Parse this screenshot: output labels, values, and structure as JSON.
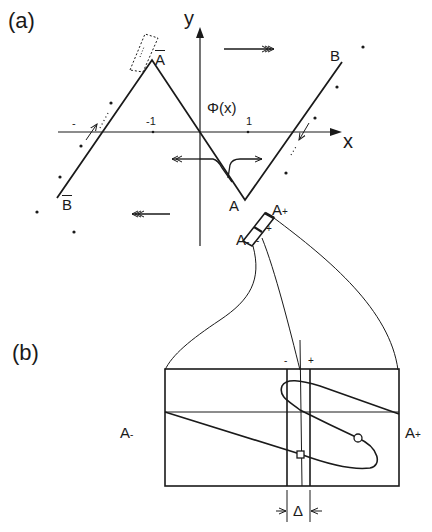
{
  "figure": {
    "panel_a": {
      "label": "(a)",
      "y_axis_label": "y",
      "x_axis_label": "x",
      "function_label": "Φ(x)",
      "tick_neg": "-1",
      "tick_pos": "1",
      "points": {
        "A_bar": "A",
        "B": "B",
        "B_bar": "B",
        "A": "A",
        "A_plus": "A",
        "A_plus_sub": "+",
        "A_minus": "A",
        "A_minus_sub": "-"
      },
      "sign_minus_left": "-",
      "box_plus": "+",
      "box_minus": "-"
    },
    "panel_b": {
      "label": "(b)",
      "left_label": "A",
      "left_sub": "-",
      "right_label": "A",
      "right_sub": "+",
      "strip_minus": "-",
      "strip_plus": "+",
      "delta": "Δ"
    },
    "colors": {
      "ink": "#1a1a1a",
      "background": "#ffffff"
    }
  }
}
